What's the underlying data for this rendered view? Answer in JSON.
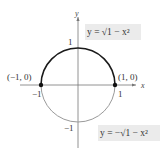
{
  "diagram": {
    "axes": {
      "x_label": "x",
      "y_label": "y"
    },
    "ticks": {
      "x_pos": "1",
      "x_neg": "−1",
      "y_pos": "1",
      "y_neg": "−1"
    },
    "points": [
      {
        "label": "(−1, 0)",
        "x": -1,
        "y": 0
      },
      {
        "label": "(1, 0)",
        "x": 1,
        "y": 0
      }
    ],
    "curves": [
      {
        "name": "upper",
        "equation": "y = √1 − x²",
        "color": "#1a1a1a"
      },
      {
        "name": "lower",
        "equation": "y = −√1 − x²",
        "color": "#9a9a9a"
      }
    ],
    "colors": {
      "axis": "#777777",
      "label_box": "#ebebeb"
    }
  }
}
